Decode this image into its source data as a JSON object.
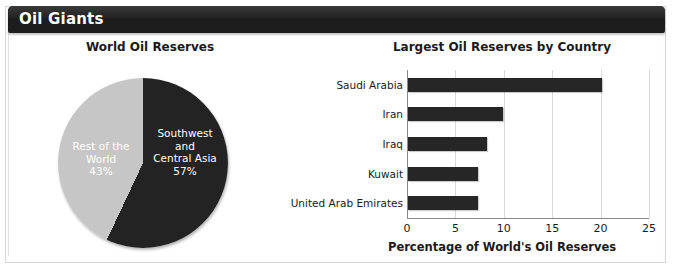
{
  "header": {
    "title": "Oil Giants"
  },
  "chart_data": [
    {
      "type": "pie",
      "title": "World Oil Reserves",
      "categories": [
        "Southwest and Central Asia",
        "Rest of the World"
      ],
      "values": [
        57,
        43
      ],
      "unit": "%",
      "slices": [
        {
          "label_lines": [
            "Southwest",
            "and",
            "Central Asia"
          ],
          "label": "Southwest and Central Asia",
          "value": 57,
          "value_label": "57%",
          "color": "#232323",
          "text_color": "#ffffff"
        },
        {
          "label_lines": [
            "Rest of the",
            "World"
          ],
          "label": "Rest of the World",
          "value": 43,
          "value_label": "43%",
          "color": "#c6c6c6",
          "text_color": "#ffffff"
        }
      ],
      "start_angle": 0,
      "direction": "clockwise",
      "legend": "none"
    },
    {
      "type": "bar",
      "orientation": "horizontal",
      "title": "Largest Oil Reserves by Country",
      "xlabel": "Percentage of World's Oil Reserves",
      "ylabel": "",
      "categories": [
        "Saudi Arabia",
        "Iran",
        "Iraq",
        "Kuwait",
        "United Arab Emirates"
      ],
      "values": [
        20.0,
        9.8,
        8.2,
        7.2,
        7.2
      ],
      "xlim": [
        0,
        25
      ],
      "xticks": [
        0,
        5,
        10,
        15,
        20,
        25
      ],
      "xtick_labels": [
        "0",
        "5",
        "10",
        "15",
        "20",
        "25"
      ],
      "grid": "vertical",
      "bar_color": "#262626",
      "legend": "none"
    }
  ]
}
